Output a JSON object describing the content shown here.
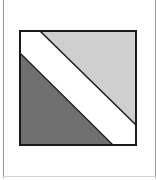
{
  "diagram": {
    "type": "square-with-diagonal-band",
    "colors": {
      "light_region": "#cfcfcf",
      "dark_region": "#6f6f6f",
      "band": "#ffffff",
      "outline": "#1a1a1a",
      "frame": "#9a9a9a"
    },
    "square": {
      "x": 20,
      "y": 31,
      "width": 116,
      "height": 114
    },
    "regions": {
      "top_right_triangle": {
        "points": "40,31 136,31 136,125",
        "fill": "#cfcfcf"
      },
      "bottom_left_triangle": {
        "points": "20,53 20,145 113,145",
        "fill": "#6f6f6f"
      },
      "white_band": {
        "points": "20,31 40,31 136,125 136,145 113,145 20,53",
        "fill": "#ffffff"
      }
    },
    "lines": {
      "upper_diagonal": {
        "x1": 40,
        "y1": 31,
        "x2": 136,
        "y2": 125
      },
      "lower_diagonal": {
        "x1": 20,
        "y1": 53,
        "x2": 113,
        "y2": 145
      }
    }
  }
}
